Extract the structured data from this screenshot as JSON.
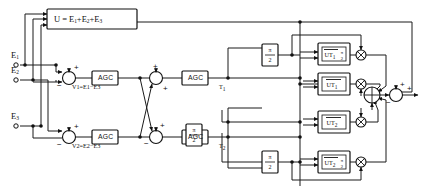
{
  "diagram": {
    "colors": {
      "line": "#1a1a1a",
      "box_fill": "#ffffff",
      "background": "#ffffff"
    },
    "inputs": [
      {
        "name": "input-e1",
        "label": "E",
        "sub": "1"
      },
      {
        "name": "input-e2",
        "label": "E",
        "sub": "2"
      },
      {
        "name": "input-e3",
        "label": "E",
        "sub": "3"
      }
    ],
    "sum_box": {
      "label": "U = E",
      "expr_rest": "+E",
      "full": "U = E1+E2+E3"
    },
    "sum_box_parts": {
      "u": "U",
      "eq": "=",
      "e": "E",
      "plus": "+"
    },
    "difference_labels": [
      {
        "name": "v1-label",
        "text": "V1=E1−E3"
      },
      {
        "name": "v2-label",
        "text": "V2=E2−E3"
      }
    ],
    "agc_label": "AGC",
    "agc_blocks": [
      {
        "name": "agc-top-1"
      },
      {
        "name": "agc-top-2"
      },
      {
        "name": "agc-bottom-1"
      },
      {
        "name": "agc-bottom-2"
      }
    ],
    "phase_blocks": [
      {
        "name": "phase-shift-mid-bottom",
        "numerator": "π",
        "denominator": "2"
      },
      {
        "name": "phase-shift-ut1",
        "numerator": "π",
        "denominator": "2"
      },
      {
        "name": "phase-shift-ut2",
        "numerator": "π",
        "denominator": "2"
      }
    ],
    "ut_blocks": [
      {
        "name": "ut1-quad-block",
        "base": "UT",
        "sub": "1",
        "frac_num": "π",
        "frac_den": "2",
        "has_frac": true
      },
      {
        "name": "ut1-block",
        "base": "UT",
        "sub": "1",
        "has_frac": false
      },
      {
        "name": "ut2-block",
        "base": "UT",
        "sub": "2",
        "has_frac": false
      },
      {
        "name": "ut2-quad-block",
        "base": "UT",
        "sub": "2",
        "frac_num": "π",
        "frac_den": "2",
        "has_frac": true
      }
    ],
    "path_labels": [
      {
        "name": "t1-label",
        "base": "T",
        "sub": "1"
      },
      {
        "name": "t2-label",
        "base": "T",
        "sub": "2"
      }
    ],
    "signs": {
      "plus": "+",
      "minus": "−"
    },
    "summers": [
      {
        "name": "summer-v1",
        "plus_top": "+",
        "minus_left": "−"
      },
      {
        "name": "summer-v2",
        "plus_top": "+",
        "minus_left": "−"
      },
      {
        "name": "summer-cross-top",
        "plus_top": "+",
        "plus_bottom": "+"
      },
      {
        "name": "summer-cross-bottom",
        "plus_top": "+",
        "minus_left": "−"
      },
      {
        "name": "summer-output",
        "plus_top": "+",
        "minus_left": "−"
      }
    ],
    "multipliers": [
      {
        "name": "multiplier-ut1-quad",
        "glyph": "⊗"
      },
      {
        "name": "multiplier-ut1",
        "glyph": "⊗"
      },
      {
        "name": "multiplier-ut2",
        "glyph": "⊗"
      },
      {
        "name": "multiplier-ut2-quad",
        "glyph": "⊗"
      }
    ],
    "adder": {
      "name": "adder-node",
      "glyph": "⊕"
    }
  }
}
